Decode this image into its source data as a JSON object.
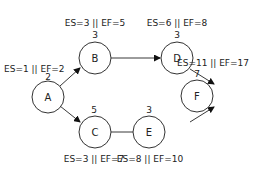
{
  "diagram": {
    "type": "activity-on-node network",
    "nodes": [
      {
        "id": "A",
        "duration": "2",
        "es_ef": "ES=1 || EF=2"
      },
      {
        "id": "B",
        "duration": "3",
        "es_ef": "ES=3 || EF=5"
      },
      {
        "id": "C",
        "duration": "5",
        "es_ef": "ES=3 || EF=7"
      },
      {
        "id": "D",
        "duration": "3",
        "es_ef": "ES=6 || EF=8"
      },
      {
        "id": "E",
        "duration": "3",
        "es_ef": "ES=8 || EF=10"
      },
      {
        "id": "F",
        "duration": "7",
        "es_ef": "ES=11 || EF=17"
      }
    ],
    "edges": [
      [
        "A",
        "B"
      ],
      [
        "A",
        "C"
      ],
      [
        "B",
        "D"
      ],
      [
        "C",
        "E"
      ],
      [
        "D",
        "F"
      ],
      [
        "E",
        "F"
      ]
    ]
  }
}
